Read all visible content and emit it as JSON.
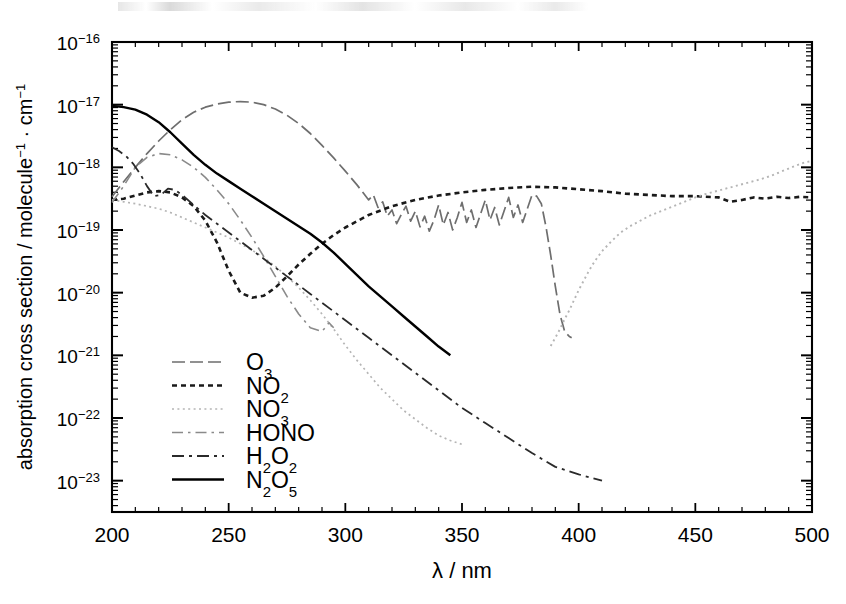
{
  "chart_data": {
    "type": "line",
    "title": "",
    "xlabel": "λ / nm",
    "ylabel": "absorption cross section / molecule⁻¹ · cm⁻¹",
    "xlim": [
      200,
      500
    ],
    "ylim_log10": [
      -23.5,
      -16
    ],
    "xscale": "linear",
    "yscale": "log",
    "grid": false,
    "legend_position": "lower-left-inside",
    "xticks": [
      200,
      250,
      300,
      350,
      400,
      450,
      500
    ],
    "xtick_labels": [
      "200",
      "250",
      "300",
      "350",
      "400",
      "450",
      "500"
    ],
    "yticks_log10": [
      -16,
      -17,
      -18,
      -19,
      -20,
      -21,
      -22,
      -23
    ],
    "ytick_labels": [
      "10⁻¹⁶",
      "10⁻¹⁷",
      "10⁻¹⁸",
      "10⁻¹⁹",
      "10⁻²⁰",
      "10⁻²¹",
      "10⁻²²",
      "10⁻²³"
    ],
    "minor_ticks": "log decade subdivisions on y-axis, 10 nm spacing on x-axis",
    "series": [
      {
        "name": "O₃",
        "label": "O₃",
        "style": "dash-dot",
        "color": "#6e6e6e",
        "width": 1.7,
        "x": [
          200,
          205,
          210,
          215,
          220,
          225,
          230,
          235,
          240,
          245,
          250,
          255,
          260,
          265,
          270,
          275,
          280,
          285,
          290,
          295,
          300,
          305,
          310,
          312,
          314,
          316,
          318,
          320,
          322,
          324,
          326,
          328,
          330,
          332,
          334,
          336,
          338,
          340,
          342,
          344,
          346,
          348,
          350,
          352,
          354,
          356,
          358,
          360,
          362,
          364,
          366,
          368,
          370,
          372,
          374,
          376,
          378,
          380,
          382,
          384,
          386,
          388,
          390,
          392,
          394,
          396,
          397
        ],
        "y_log10": [
          -18.47,
          -18.23,
          -18.0,
          -17.78,
          -17.58,
          -17.4,
          -17.24,
          -17.12,
          -17.04,
          -16.99,
          -16.96,
          -16.95,
          -16.96,
          -17.0,
          -17.07,
          -17.17,
          -17.3,
          -17.46,
          -17.65,
          -17.85,
          -18.06,
          -18.28,
          -18.52,
          -18.44,
          -18.64,
          -18.55,
          -18.78,
          -18.68,
          -18.9,
          -18.75,
          -18.62,
          -18.86,
          -18.7,
          -18.95,
          -18.78,
          -19.02,
          -18.84,
          -18.6,
          -18.92,
          -18.72,
          -19.0,
          -18.8,
          -18.56,
          -18.88,
          -18.68,
          -18.96,
          -18.74,
          -18.52,
          -18.84,
          -18.64,
          -18.92,
          -18.7,
          -18.48,
          -18.8,
          -18.6,
          -18.88,
          -18.66,
          -18.44,
          -18.46,
          -18.58,
          -18.95,
          -19.4,
          -19.9,
          -20.35,
          -20.62,
          -20.7,
          -20.72
        ],
        "description": "Hartley band peaking near 255 nm at 1.1e-17, Huggins bands with vibrational structure 310-395 nm, sharp cutoff near 397 nm"
      },
      {
        "name": "NO₂",
        "label": "NO₂",
        "style": "dotted",
        "color": "#1a1a1a",
        "width": 2.6,
        "x": [
          200,
          205,
          210,
          215,
          220,
          225,
          230,
          235,
          240,
          245,
          250,
          255,
          260,
          265,
          270,
          275,
          280,
          285,
          290,
          295,
          300,
          310,
          320,
          330,
          340,
          350,
          360,
          370,
          380,
          390,
          400,
          410,
          420,
          430,
          440,
          450,
          460,
          465,
          470,
          475,
          480,
          485,
          490,
          495,
          500
        ],
        "y_log10": [
          -18.52,
          -18.5,
          -18.45,
          -18.4,
          -18.38,
          -18.4,
          -18.48,
          -18.62,
          -18.85,
          -19.2,
          -19.65,
          -20.0,
          -20.08,
          -20.05,
          -19.92,
          -19.74,
          -19.55,
          -19.38,
          -19.22,
          -19.08,
          -18.96,
          -18.76,
          -18.62,
          -18.52,
          -18.45,
          -18.4,
          -18.36,
          -18.33,
          -18.31,
          -18.32,
          -18.35,
          -18.38,
          -18.42,
          -18.44,
          -18.46,
          -18.46,
          -18.48,
          -18.55,
          -18.52,
          -18.48,
          -18.5,
          -18.47,
          -18.49,
          -18.47,
          -18.48
        ],
        "description": "broad maximum near 220 nm, deep minimum ~8e-21 near 258 nm, rising plateau ~6e-19 from 350-500 nm"
      },
      {
        "name": "NO₃",
        "label": "NO₃",
        "style": "fine-dotted",
        "color": "#b5b5b5",
        "width": 1.7,
        "x": [
          200,
          205,
          210,
          215,
          220,
          225,
          230,
          235,
          240,
          245,
          250,
          255,
          260,
          265,
          270,
          275,
          280,
          285,
          290,
          295,
          300,
          305,
          310,
          315,
          320,
          325,
          330,
          335,
          340,
          345,
          350
        ],
        "y_log10": [
          -18.52,
          -18.55,
          -18.58,
          -18.62,
          -18.66,
          -18.72,
          -18.8,
          -18.88,
          -18.96,
          -19.04,
          -19.12,
          -19.22,
          -19.32,
          -19.44,
          -19.58,
          -19.74,
          -19.92,
          -20.12,
          -20.34,
          -20.58,
          -20.84,
          -21.08,
          -21.3,
          -21.52,
          -21.7,
          -21.88,
          -22.02,
          -22.16,
          -22.28,
          -22.36,
          -22.42
        ],
        "description": "weak UV tail from 200 nm declining to ~4e-23 near 350 nm"
      },
      {
        "name": "NO₃-vis",
        "label": "NO₃",
        "style": "fine-dotted",
        "color": "#b5b5b5",
        "width": 1.9,
        "x": [
          388,
          390,
          392,
          394,
          396,
          398,
          400,
          402,
          404,
          406,
          408,
          410,
          414,
          418,
          422,
          426,
          430,
          434,
          438,
          442,
          446,
          450,
          454,
          458,
          462,
          466,
          470,
          474,
          478,
          482,
          486,
          490,
          494,
          497,
          500
        ],
        "y_log10": [
          -20.85,
          -20.72,
          -20.58,
          -20.42,
          -20.28,
          -20.12,
          -19.96,
          -19.82,
          -19.68,
          -19.55,
          -19.44,
          -19.34,
          -19.18,
          -19.04,
          -18.94,
          -18.86,
          -18.78,
          -18.72,
          -18.66,
          -18.6,
          -18.54,
          -18.48,
          -18.43,
          -18.39,
          -18.35,
          -18.31,
          -18.27,
          -18.23,
          -18.19,
          -18.14,
          -18.08,
          -18.02,
          -17.96,
          -17.92,
          -17.9
        ],
        "description": "visible NO3 absorption rising steeply from ~388 nm to 1.2e-18 at 500 nm, crosses NO2 near 450 nm"
      },
      {
        "name": "HONO",
        "label": "HONO",
        "style": "dash-dot-light",
        "color": "#8a8a8a",
        "width": 1.6,
        "x": [
          200,
          205,
          210,
          215,
          220,
          225,
          230,
          235,
          240,
          245,
          250,
          255,
          260,
          265,
          270,
          275,
          280,
          285,
          290,
          293,
          295
        ],
        "y_log10": [
          -18.56,
          -18.3,
          -18.0,
          -17.84,
          -17.78,
          -17.8,
          -17.88,
          -18.0,
          -18.16,
          -18.36,
          -18.58,
          -18.84,
          -19.12,
          -19.42,
          -19.74,
          -20.06,
          -20.34,
          -20.56,
          -20.62,
          -20.48,
          -20.56
        ],
        "description": "band maximum near 1.7e-18 at 220 nm, decaying to ~3e-21 near 295 nm where trace ends"
      },
      {
        "name": "H₂O₂",
        "label": "H₂O₂",
        "style": "dash-dot-dark",
        "color": "#2a2a2a",
        "width": 1.8,
        "x": [
          200,
          203,
          206,
          209,
          212,
          215,
          218,
          221,
          224,
          227,
          230,
          235,
          240,
          245,
          250,
          255,
          260,
          265,
          270,
          275,
          280,
          285,
          290,
          295,
          300,
          310,
          320,
          330,
          340,
          350,
          355,
          360,
          370,
          380,
          390,
          400,
          410
        ],
        "y_log10": [
          -17.68,
          -17.74,
          -17.82,
          -17.94,
          -18.1,
          -18.3,
          -18.46,
          -18.44,
          -18.34,
          -18.36,
          -18.44,
          -18.6,
          -18.76,
          -18.9,
          -19.04,
          -19.18,
          -19.32,
          -19.46,
          -19.6,
          -19.74,
          -19.88,
          -20.02,
          -20.16,
          -20.3,
          -20.44,
          -20.72,
          -21.0,
          -21.28,
          -21.56,
          -21.84,
          -21.96,
          -22.08,
          -22.32,
          -22.56,
          -22.78,
          -22.9,
          -23.0
        ],
        "description": "starts 2.1e-18 at 200 nm with a shoulder near 221 nm, smooth log-linear decay to 1e-23 at 410 nm"
      },
      {
        "name": "N₂O₅",
        "label": "N₂O₅",
        "style": "solid",
        "color": "#000000",
        "width": 2.4,
        "x": [
          200,
          205,
          210,
          215,
          220,
          225,
          230,
          235,
          240,
          245,
          250,
          255,
          260,
          265,
          270,
          275,
          280,
          285,
          290,
          295,
          300,
          305,
          310,
          315,
          320,
          325,
          330,
          335,
          340,
          345
        ],
        "y_log10": [
          -17.02,
          -17.04,
          -17.08,
          -17.16,
          -17.28,
          -17.44,
          -17.62,
          -17.8,
          -17.96,
          -18.1,
          -18.22,
          -18.34,
          -18.46,
          -18.58,
          -18.7,
          -18.82,
          -18.94,
          -19.06,
          -19.2,
          -19.36,
          -19.54,
          -19.72,
          -19.9,
          -20.06,
          -20.22,
          -20.38,
          -20.54,
          -20.7,
          -20.86,
          -21.0
        ],
        "description": "highest at 200 nm (9.5e-18), monotonic decline, trace ends near 345 nm at 1e-21"
      }
    ]
  },
  "legend": {
    "entries": [
      {
        "label": "O₃",
        "series": "O₃"
      },
      {
        "label": "NO₂",
        "series": "NO₂"
      },
      {
        "label": "NO₃",
        "series": "NO₃"
      },
      {
        "label": "HONO",
        "series": "HONO"
      },
      {
        "label": "H₂O₂",
        "series": "H₂O₂"
      },
      {
        "label": "N₂O₅",
        "series": "N₂O₅"
      }
    ]
  },
  "axes": {
    "x_label": "λ / nm",
    "y_label": "absorption cross section / molecule⁻¹ · cm⁻¹"
  }
}
